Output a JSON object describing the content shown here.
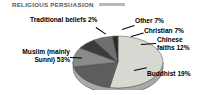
{
  "chart_title": "RELIGIOUS PERSUASION",
  "labels": {
    "traditional": "Traditional beliefs 2%",
    "other": "Other 7%",
    "christian": "Christian 7%",
    "chinese_line1": "Chinese",
    "chinese_line2": "faiths 12%",
    "buddhist": "Buddhist 19%",
    "muslim_line1": "Muslim (mainly",
    "muslim_line2": "Sunni) 53%"
  },
  "colors": {
    "muslim": "#d8d8d2",
    "traditional": "#2b2b2b",
    "other": "#6f6f6f",
    "christian": "#3c3c3c",
    "chinese": "#8a8a8a",
    "buddhist": "#5d5d5d",
    "side_wall": "#a9a9a9",
    "outline": "#4a4a4a",
    "title": "#575757",
    "title_rule": "#b9b9b9",
    "background": "#ffffff"
  },
  "chart_data": {
    "type": "pie",
    "title": "RELIGIOUS PERSUASION",
    "subtitle": "",
    "xlabel": "",
    "ylabel": "",
    "units": "percent",
    "three_d": true,
    "legend_position": "external-callout-labels",
    "grid": false,
    "total": 100,
    "categories": [
      "Muslim (mainly Sunni)",
      "Buddhist",
      "Chinese faiths",
      "Christian",
      "Other",
      "Traditional beliefs"
    ],
    "values": [
      53,
      19,
      12,
      7,
      7,
      2
    ],
    "slices": [
      {
        "label": "Muslim (mainly Sunni)",
        "value": 53,
        "display": "Muslim (mainly Sunni) 53%",
        "color": "#d8d8d2"
      },
      {
        "label": "Buddhist",
        "value": 19,
        "display": "Buddhist 19%",
        "color": "#5d5d5d"
      },
      {
        "label": "Chinese faiths",
        "value": 12,
        "display": "Chinese faiths 12%",
        "color": "#8a8a8a"
      },
      {
        "label": "Christian",
        "value": 7,
        "display": "Christian 7%",
        "color": "#3c3c3c"
      },
      {
        "label": "Other",
        "value": 7,
        "display": "Other 7%",
        "color": "#6f6f6f"
      },
      {
        "label": "Traditional beliefs",
        "value": 2,
        "display": "Traditional beliefs 2%",
        "color": "#2b2b2b"
      }
    ]
  }
}
